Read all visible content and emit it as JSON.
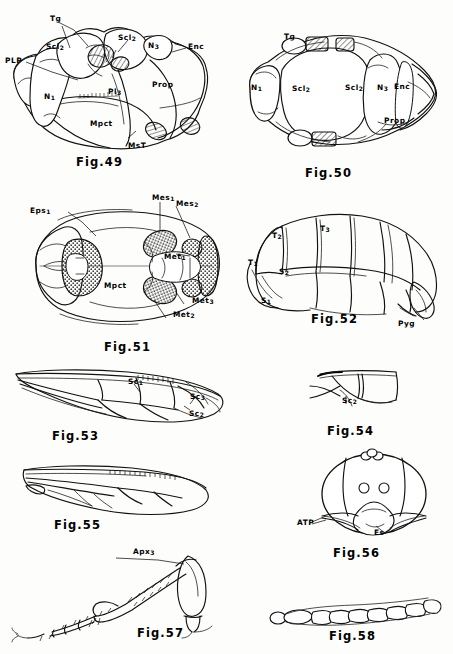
{
  "plate": {
    "title": "Morphological plate Figs. 49-58",
    "background_color": "#fdfdfb",
    "ink_color": "#111111"
  },
  "figures": [
    {
      "id": "fig49",
      "caption": "Fig.49",
      "subject": "thorax-lateral-view",
      "labels": [
        {
          "name": "Tg",
          "text": "Tg",
          "sub": "",
          "x": 50,
          "y": 15
        },
        {
          "name": "Scl2",
          "text": "Scl",
          "sub": "2",
          "x": 46,
          "y": 43
        },
        {
          "name": "Scl2b",
          "text": "Scl",
          "sub": "2",
          "x": 118,
          "y": 34
        },
        {
          "name": "N3",
          "text": "N",
          "sub": "3",
          "x": 148,
          "y": 42
        },
        {
          "name": "Enc",
          "text": "Enc",
          "sub": "",
          "x": 188,
          "y": 43
        },
        {
          "name": "PLP",
          "text": "PLP",
          "sub": "",
          "x": 5,
          "y": 57
        },
        {
          "name": "N1",
          "text": "N",
          "sub": "1",
          "x": 44,
          "y": 93
        },
        {
          "name": "Prop",
          "text": "Prop",
          "sub": "",
          "x": 152,
          "y": 81
        },
        {
          "name": "Pl3",
          "text": "Pl",
          "sub": "3",
          "x": 108,
          "y": 88
        },
        {
          "name": "Mpct",
          "text": "Mpct",
          "sub": "",
          "x": 90,
          "y": 120
        },
        {
          "name": "MsT",
          "text": "MsT",
          "sub": "",
          "x": 128,
          "y": 142
        }
      ]
    },
    {
      "id": "fig50",
      "caption": "Fig.50",
      "subject": "thorax-dorsal-view",
      "labels": [
        {
          "name": "Tg",
          "text": "Tg",
          "sub": "",
          "x": 284,
          "y": 33
        },
        {
          "name": "N1",
          "text": "N",
          "sub": "1",
          "x": 251,
          "y": 84
        },
        {
          "name": "Scl2",
          "text": "Scl",
          "sub": "2",
          "x": 292,
          "y": 85
        },
        {
          "name": "Scl2b",
          "text": "Scl",
          "sub": "2",
          "x": 345,
          "y": 84
        },
        {
          "name": "N3",
          "text": "N",
          "sub": "3",
          "x": 377,
          "y": 84
        },
        {
          "name": "Enc",
          "text": "Enc",
          "sub": "",
          "x": 394,
          "y": 83
        },
        {
          "name": "Prop",
          "text": "Prop",
          "sub": "",
          "x": 384,
          "y": 117
        }
      ]
    },
    {
      "id": "fig51",
      "caption": "Fig.51",
      "subject": "thorax-ventral-view",
      "labels": [
        {
          "name": "Eps1",
          "text": "Eps",
          "sub": "1",
          "x": 30,
          "y": 207
        },
        {
          "name": "Mes1",
          "text": "Mes",
          "sub": "1",
          "x": 152,
          "y": 194
        },
        {
          "name": "Mes2",
          "text": "Mes",
          "sub": "2",
          "x": 176,
          "y": 200
        },
        {
          "name": "Met1",
          "text": "Met",
          "sub": "1",
          "x": 164,
          "y": 253
        },
        {
          "name": "Mpct",
          "text": "Mpct",
          "sub": "",
          "x": 104,
          "y": 282
        },
        {
          "name": "Met3",
          "text": "Met",
          "sub": "3",
          "x": 192,
          "y": 297
        },
        {
          "name": "Met2",
          "text": "Met",
          "sub": "2",
          "x": 173,
          "y": 311
        }
      ]
    },
    {
      "id": "fig52",
      "caption": "Fig.52",
      "subject": "abdomen-lateral-view",
      "labels": [
        {
          "name": "T2",
          "text": "T",
          "sub": "2",
          "x": 272,
          "y": 232
        },
        {
          "name": "T3",
          "text": "T",
          "sub": "3",
          "x": 320,
          "y": 225
        },
        {
          "name": "T1",
          "text": "T",
          "sub": "1",
          "x": 248,
          "y": 259
        },
        {
          "name": "S2",
          "text": "S",
          "sub": "2",
          "x": 279,
          "y": 268
        },
        {
          "name": "S1",
          "text": "S",
          "sub": "1",
          "x": 261,
          "y": 297
        },
        {
          "name": "Pyg",
          "text": "Pyg",
          "sub": "",
          "x": 398,
          "y": 320
        }
      ]
    },
    {
      "id": "fig53",
      "caption": "Fig.53",
      "subject": "fore-wing-venation",
      "labels": [
        {
          "name": "Sc1",
          "text": "Sc",
          "sub": "1",
          "x": 128,
          "y": 378
        },
        {
          "name": "Sc3",
          "text": "Sc",
          "sub": "3",
          "x": 190,
          "y": 393
        },
        {
          "name": "Sc2",
          "text": "Sc",
          "sub": "2",
          "x": 189,
          "y": 410
        }
      ]
    },
    {
      "id": "fig54",
      "caption": "Fig.54",
      "subject": "wing-cell-detail",
      "labels": [
        {
          "name": "Sc2",
          "text": "Sc",
          "sub": "2",
          "x": 342,
          "y": 397
        }
      ]
    },
    {
      "id": "fig55",
      "caption": "Fig.55",
      "subject": "hind-wing-venation",
      "labels": []
    },
    {
      "id": "fig56",
      "caption": "Fig.56",
      "subject": "head-frontal-view",
      "labels": [
        {
          "name": "ATP",
          "text": "ATP",
          "sub": "",
          "x": 297,
          "y": 519
        },
        {
          "name": "Es",
          "text": "Es",
          "sub": "",
          "x": 374,
          "y": 529
        }
      ]
    },
    {
      "id": "fig57",
      "caption": "Fig.57",
      "subject": "hind-leg",
      "labels": [
        {
          "name": "Apx3",
          "text": "Apx",
          "sub": "3",
          "x": 133,
          "y": 548
        }
      ]
    },
    {
      "id": "fig58",
      "caption": "Fig.58",
      "subject": "antenna",
      "labels": []
    }
  ],
  "captions": [
    {
      "name": "fig49-caption",
      "text": "Fig.49",
      "x": 76,
      "y": 155
    },
    {
      "name": "fig50-caption",
      "text": "Fig.50",
      "x": 305,
      "y": 166
    },
    {
      "name": "fig51-caption",
      "text": "Fig.51",
      "x": 104,
      "y": 340
    },
    {
      "name": "fig52-caption",
      "text": "Fig.52",
      "x": 311,
      "y": 312
    },
    {
      "name": "fig53-caption",
      "text": "Fig.53",
      "x": 52,
      "y": 429
    },
    {
      "name": "fig54-caption",
      "text": "Fig.54",
      "x": 327,
      "y": 424
    },
    {
      "name": "fig55-caption",
      "text": "Fig.55",
      "x": 54,
      "y": 518
    },
    {
      "name": "fig56-caption",
      "text": "Fig.56",
      "x": 333,
      "y": 546
    },
    {
      "name": "fig57-caption",
      "text": "Fig.57",
      "x": 137,
      "y": 626
    },
    {
      "name": "fig58-caption",
      "text": "Fig.58",
      "x": 329,
      "y": 629
    }
  ]
}
